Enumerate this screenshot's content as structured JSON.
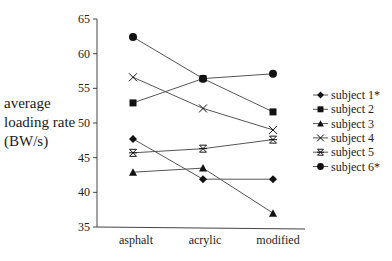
{
  "chart_data": {
    "type": "line",
    "title": "",
    "xlabel": "",
    "ylabel": "average loading rate (BW/s)",
    "ylabel_lines": [
      "average",
      "loading rate",
      "(BW/s)"
    ],
    "categories": [
      "asphalt",
      "acrylic",
      "modified"
    ],
    "yticks": [
      35,
      40,
      45,
      50,
      55,
      60,
      65
    ],
    "ylim": [
      35,
      65
    ],
    "grid": false,
    "legend_position": "right",
    "series": [
      {
        "name": "subject 1*",
        "marker": "diamond",
        "values": [
          47.7,
          41.9,
          41.9
        ]
      },
      {
        "name": "subject 2",
        "marker": "square",
        "values": [
          52.9,
          56.4,
          51.6
        ]
      },
      {
        "name": "subject 3",
        "marker": "triangle",
        "values": [
          42.9,
          43.5,
          37.0
        ]
      },
      {
        "name": "subject 4",
        "marker": "x",
        "values": [
          56.6,
          52.1,
          49.0
        ]
      },
      {
        "name": "subject 5",
        "marker": "asterisk",
        "values": [
          45.7,
          46.3,
          47.6
        ]
      },
      {
        "name": "subject 6*",
        "marker": "circle",
        "values": [
          62.4,
          56.4,
          57.1
        ]
      }
    ],
    "colors": {
      "line": "#555555",
      "marker": "#111111",
      "axis": "#444444"
    }
  }
}
